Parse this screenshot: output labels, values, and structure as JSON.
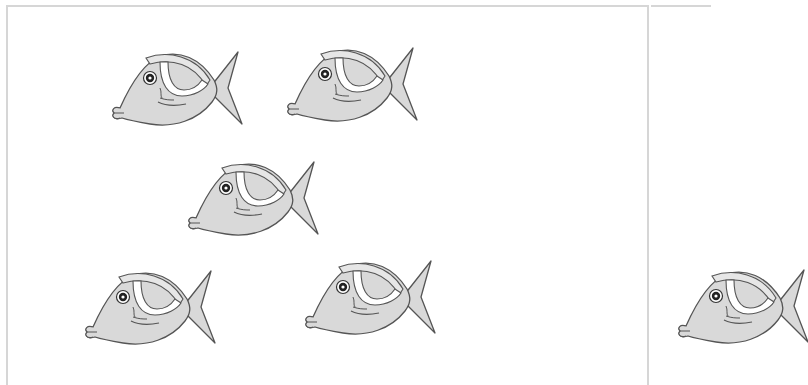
{
  "scene": {
    "description": "Worksheet-style illustration of grey cartoon fish",
    "left_panel": {
      "fish_count": 5,
      "fish": [
        {
          "x": 110,
          "y": 50
        },
        {
          "x": 285,
          "y": 46
        },
        {
          "x": 186,
          "y": 160
        },
        {
          "x": 83,
          "y": 269
        },
        {
          "x": 303,
          "y": 259
        }
      ]
    },
    "right_panel": {
      "fish_count_visible": 1,
      "fish": [
        {
          "x": 676,
          "y": 268,
          "partial": true
        }
      ]
    },
    "colors": {
      "fish_body": "#d9d9d9",
      "fish_outline": "#555555",
      "fin_band": "#ffffff",
      "panel_border": "#d6d6d6",
      "eye": "#222222"
    }
  }
}
